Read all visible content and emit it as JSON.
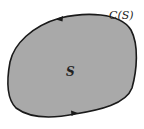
{
  "diagram": {
    "region_label": "S",
    "curve_label": "C(S)",
    "fill_color": "#a9a9a9",
    "stroke_color": "#1a1a1a",
    "orientation": "counterclockwise"
  }
}
